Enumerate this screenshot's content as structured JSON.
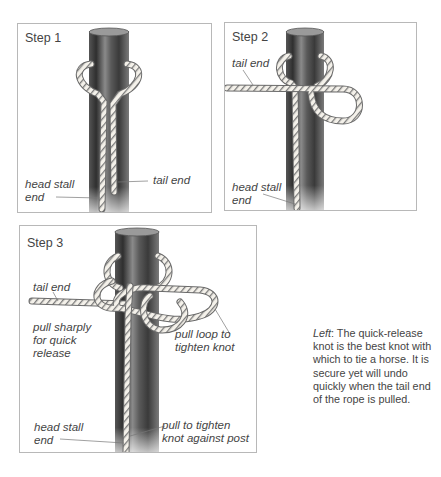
{
  "panels": [
    {
      "title": "Step 1",
      "labels": {
        "tail_end": "tail end",
        "head_stall_end": "head stall\nend"
      }
    },
    {
      "title": "Step 2",
      "labels": {
        "tail_end": "tail end",
        "head_stall_end": "head stall\nend"
      }
    },
    {
      "title": "Step 3",
      "labels": {
        "tail_end": "tail end",
        "pull_sharply": "pull sharply\nfor quick\nrelease",
        "pull_loop": "pull loop to\ntighten knot",
        "head_stall_end": "head stall\nend",
        "pull_to_tighten": "pull to tighten\nknot against post"
      }
    }
  ],
  "caption": {
    "lead": "Left",
    "text": ": The quick-release knot is the best knot with which to tie a horse. It is secure yet will undo quickly when the tail end of the rope is pulled."
  },
  "colors": {
    "post_dark": "#3a3a3a",
    "post_mid": "#6e6e6e",
    "post_light": "#b5b5b5",
    "rope": "#f4f1ea",
    "rope_line": "#6a6a6a",
    "border": "#b8b8b8"
  }
}
